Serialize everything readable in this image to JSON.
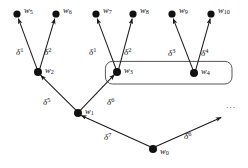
{
  "diagram": {
    "type": "directed-graph-tree",
    "background_color": "#ffffff",
    "node_color": "#111111",
    "edge_color": "#1a1a1a",
    "box_color": "#444444",
    "nodes": [
      {
        "id": "w5",
        "label": "w",
        "subscript": "5",
        "x": 17,
        "y": 14
      },
      {
        "id": "w6",
        "label": "w",
        "subscript": "6",
        "x": 56,
        "y": 14
      },
      {
        "id": "w7",
        "label": "w",
        "subscript": "7",
        "x": 96,
        "y": 14
      },
      {
        "id": "w8",
        "label": "w",
        "subscript": "8",
        "x": 133,
        "y": 14
      },
      {
        "id": "w9",
        "label": "w",
        "subscript": "9",
        "x": 172,
        "y": 14
      },
      {
        "id": "w10",
        "label": "w",
        "subscript": "10",
        "x": 211,
        "y": 14
      },
      {
        "id": "w2",
        "label": "w",
        "subscript": "2",
        "x": 38,
        "y": 72
      },
      {
        "id": "w3",
        "label": "w",
        "subscript": "3",
        "x": 117,
        "y": 72
      },
      {
        "id": "w4",
        "label": "w",
        "subscript": "4",
        "x": 194,
        "y": 73
      },
      {
        "id": "w1",
        "label": "w",
        "subscript": "1",
        "x": 78,
        "y": 113
      },
      {
        "id": "w0",
        "label": "w",
        "subscript": "0",
        "x": 153,
        "y": 149
      }
    ],
    "node_label_offsets": [
      {
        "id": "w5",
        "lx": 24,
        "ly": 6
      },
      {
        "id": "w6",
        "lx": 63,
        "ly": 6
      },
      {
        "id": "w7",
        "lx": 103,
        "ly": 6
      },
      {
        "id": "w8",
        "lx": 140,
        "ly": 6
      },
      {
        "id": "w9",
        "lx": 179,
        "ly": 6
      },
      {
        "id": "w10",
        "lx": 218,
        "ly": 6
      },
      {
        "id": "w2",
        "lx": 45,
        "ly": 66
      },
      {
        "id": "w3",
        "lx": 124,
        "ly": 66
      },
      {
        "id": "w4",
        "lx": 201,
        "ly": 67
      },
      {
        "id": "w1",
        "lx": 85,
        "ly": 107
      },
      {
        "id": "w0",
        "lx": 160,
        "ly": 147
      }
    ],
    "edges": [
      {
        "id": "e-w2-w5",
        "from": "w2",
        "to": "w5",
        "label": "δ",
        "superscript": "1",
        "lx": 16,
        "ly": 47
      },
      {
        "id": "e-w2-w6",
        "from": "w2",
        "to": "w6",
        "label": "δ",
        "superscript": "2",
        "lx": 44,
        "ly": 47
      },
      {
        "id": "e-w3-w7",
        "from": "w3",
        "to": "w7",
        "label": "δ",
        "superscript": "1",
        "lx": 89,
        "ly": 47
      },
      {
        "id": "e-w3-w8",
        "from": "w3",
        "to": "w8",
        "label": "δ",
        "superscript": "2",
        "lx": 124,
        "ly": 47
      },
      {
        "id": "e-w4-w9",
        "from": "w4",
        "to": "w9",
        "label": "δ",
        "superscript": "3",
        "lx": 168,
        "ly": 48
      },
      {
        "id": "e-w4-w10",
        "from": "w4",
        "to": "w10",
        "label": "δ",
        "superscript": "4",
        "lx": 201,
        "ly": 48
      },
      {
        "id": "e-w1-w2",
        "from": "w1",
        "to": "w2",
        "label": "δ",
        "superscript": "5",
        "lx": 43,
        "ly": 97
      },
      {
        "id": "e-w1-w3",
        "from": "w1",
        "to": "w3",
        "label": "δ",
        "superscript": "6",
        "lx": 107,
        "ly": 97
      },
      {
        "id": "e-w0-w1",
        "from": "w0",
        "to": "w1",
        "label": "δ",
        "superscript": "7",
        "lx": 104,
        "ly": 132
      },
      {
        "id": "e-w0-more",
        "from": "w0",
        "to": "more",
        "label": "δ",
        "superscript": "6",
        "lx": 184,
        "ly": 131
      }
    ],
    "continuation": {
      "id": "more",
      "text": "···",
      "arrow_tip_x": 222,
      "arrow_tip_y": 117,
      "lx": 226,
      "ly": 104
    },
    "group_box": {
      "id": "group-w3-w4",
      "x": 105,
      "y": 61,
      "width": 127,
      "height": 23,
      "radius": 7,
      "members": [
        "w3",
        "w4"
      ]
    }
  }
}
